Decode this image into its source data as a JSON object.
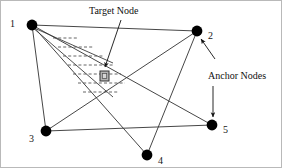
{
  "figure": {
    "background": "#ffffff",
    "border_color": "#b9b9b9",
    "width": 282,
    "height": 168
  },
  "colors": {
    "node_fill": "#000000",
    "edge_stroke": "#3c3c3c",
    "dashed_stroke": "#555555",
    "target_fill": "#b4b4b4",
    "target_stroke": "#333333",
    "text": "#101010"
  },
  "annotations": {
    "target": {
      "label": "Target Node",
      "x": 88,
      "y": 5
    },
    "anchor": {
      "label": "Anchor Nodes",
      "x": 207,
      "y": 70
    }
  },
  "nodes": [
    {
      "id": "1",
      "label": "1",
      "cx": 31,
      "cy": 24,
      "r": 5.4,
      "label_x": 9,
      "label_y": 18,
      "kind": "anchor"
    },
    {
      "id": "2",
      "label": "2",
      "cx": 196,
      "cy": 30,
      "r": 5.4,
      "label_x": 207,
      "label_y": 30,
      "kind": "anchor"
    },
    {
      "id": "3",
      "label": "3",
      "cx": 45,
      "cy": 130,
      "r": 5.4,
      "label_x": 28,
      "label_y": 133,
      "kind": "anchor"
    },
    {
      "id": "4",
      "label": "4",
      "cx": 146,
      "cy": 154,
      "r": 5.4,
      "label_x": 157,
      "label_y": 155,
      "kind": "anchor"
    },
    {
      "id": "5",
      "label": "5",
      "cx": 211,
      "cy": 124,
      "r": 5.4,
      "label_x": 222,
      "label_y": 124,
      "kind": "anchor"
    }
  ],
  "target_node": {
    "label": "target-node-marker",
    "x": 99,
    "y": 70,
    "w": 9,
    "h": 10
  },
  "edges": [
    {
      "from": "1",
      "to": "2"
    },
    {
      "from": "1",
      "to": "3"
    },
    {
      "from": "1",
      "to": "4"
    },
    {
      "from": "1",
      "to": "5"
    },
    {
      "from": "2",
      "to": "3"
    },
    {
      "from": "2",
      "to": "4"
    },
    {
      "from": "3",
      "to": "5"
    }
  ],
  "wedge": {
    "apex_x": 31,
    "apex_y": 26,
    "upper_x": 112,
    "upper_y": 62,
    "lower_x": 112,
    "lower_y": 96,
    "dash_rows": [
      {
        "x1": 52,
        "x2": 78,
        "y": 37
      },
      {
        "x1": 57,
        "x2": 92,
        "y": 46
      },
      {
        "x1": 62,
        "x2": 103,
        "y": 55
      },
      {
        "x1": 67,
        "x2": 112,
        "y": 64
      },
      {
        "x1": 72,
        "x2": 120,
        "y": 73
      },
      {
        "x1": 77,
        "x2": 124,
        "y": 82
      },
      {
        "x1": 82,
        "x2": 118,
        "y": 91
      }
    ]
  },
  "arrows": [
    {
      "name": "target-node-arrow",
      "x1": 120,
      "y1": 19,
      "x2": 104,
      "y2": 66
    },
    {
      "name": "anchor-arrow-node2",
      "x1": 214,
      "y1": 58,
      "x2": 200,
      "y2": 38
    },
    {
      "name": "anchor-arrow-node5",
      "x1": 212,
      "y1": 85,
      "x2": 212,
      "y2": 116
    }
  ]
}
